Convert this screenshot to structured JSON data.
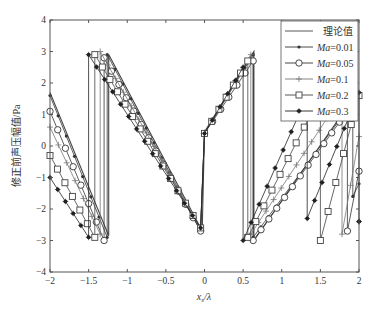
{
  "chart_data": {
    "type": "line",
    "title": "",
    "xlabel": "x_s/λ",
    "xlabel_main": "x",
    "xlabel_sub": "s",
    "xlabel_tail": "/λ",
    "ylabel": "修正前声压幅值/Pa",
    "xlim": [
      -2,
      2
    ],
    "ylim": [
      -4,
      4
    ],
    "xticks": [
      -2,
      -1.5,
      -1,
      -0.5,
      0,
      0.5,
      1,
      1.5,
      2
    ],
    "xtick_labels": [
      "−2",
      "−1.5",
      "−1",
      "−0.5",
      "0",
      "0.5",
      "1",
      "1.5",
      "2"
    ],
    "yticks": [
      -4,
      -3,
      -2,
      -1,
      0,
      1,
      2,
      3,
      4
    ],
    "ytick_labels": [
      "−4",
      "−3",
      "−2",
      "−1",
      "0",
      "1",
      "2",
      "3",
      "4"
    ],
    "grid": false,
    "legend_position": "upper right",
    "series": [
      {
        "name": "理论值",
        "name_prefix": "",
        "name_value": "理论值",
        "marker": "none",
        "color": "#444444",
        "segments": [
          [
            [
              -2,
              1.7
            ],
            [
              -1.24,
              -2.85
            ]
          ],
          [
            [
              -1.24,
              2.9
            ],
            [
              -0.03,
              -2.7
            ]
          ],
          [
            [
              0.0,
              0.45
            ],
            [
              0.64,
              3.0
            ]
          ],
          [
            [
              0.64,
              -3.0
            ],
            [
              1.95,
              1.6
            ]
          ]
        ]
      },
      {
        "name": "Ma=0.01",
        "name_prefix": "Ma",
        "name_value": "=0.01",
        "marker": "dot",
        "color": "#333333",
        "segments": [
          [
            [
              -2,
              1.6
            ],
            [
              -1.26,
              -2.9
            ]
          ],
          [
            [
              -1.26,
              2.9
            ],
            [
              -0.05,
              -2.7
            ]
          ],
          [
            [
              0.0,
              0.4
            ],
            [
              0.63,
              2.9
            ]
          ],
          [
            [
              0.63,
              -2.9
            ],
            [
              1.92,
              1.4
            ]
          ],
          [
            [
              1.92,
              -1.6
            ],
            [
              2.0,
              -1.2
            ]
          ]
        ]
      },
      {
        "name": "Ma=0.05",
        "name_prefix": "Ma",
        "name_value": "=0.05",
        "marker": "circle",
        "color": "#333333",
        "segments": [
          [
            [
              -2,
              1.1
            ],
            [
              -1.3,
              -3.0
            ]
          ],
          [
            [
              -1.3,
              2.8
            ],
            [
              -0.05,
              -2.7
            ]
          ],
          [
            [
              0.0,
              0.4
            ],
            [
              0.63,
              2.7
            ]
          ],
          [
            [
              0.63,
              -3.0
            ],
            [
              1.85,
              1.1
            ]
          ],
          [
            [
              1.85,
              -2.7
            ],
            [
              2.0,
              -0.8
            ]
          ]
        ]
      },
      {
        "name": "Ma=0.1",
        "name_prefix": "Ma",
        "name_value": "=0.1",
        "marker": "plus",
        "color": "#777777",
        "segments": [
          [
            [
              -2,
              0.6
            ],
            [
              -1.35,
              -2.8
            ]
          ],
          [
            [
              -1.35,
              3.0
            ],
            [
              -0.05,
              -2.6
            ]
          ],
          [
            [
              0.0,
              0.4
            ],
            [
              0.6,
              2.9
            ]
          ],
          [
            [
              0.6,
              -2.8
            ],
            [
              1.78,
              1.6
            ]
          ],
          [
            [
              1.78,
              -2.8
            ],
            [
              2.0,
              0.3
            ]
          ]
        ]
      },
      {
        "name": "Ma=0.2",
        "name_prefix": "Ma",
        "name_value": "=0.2",
        "marker": "square",
        "color": "#444444",
        "segments": [
          [
            [
              -2,
              -0.3
            ],
            [
              -1.42,
              -2.9
            ]
          ],
          [
            [
              -1.42,
              2.9
            ],
            [
              -0.05,
              -2.6
            ]
          ],
          [
            [
              0.0,
              0.4
            ],
            [
              0.56,
              2.7
            ]
          ],
          [
            [
              0.56,
              -2.9
            ],
            [
              1.5,
              1.6
            ]
          ],
          [
            [
              1.5,
              -3.0
            ],
            [
              2.0,
              1.6
            ]
          ]
        ]
      },
      {
        "name": "Ma=0.3",
        "name_prefix": "Ma",
        "name_value": "=0.3",
        "marker": "star",
        "color": "#222222",
        "segments": [
          [
            [
              -2,
              -1.0
            ],
            [
              -1.5,
              -2.9
            ]
          ],
          [
            [
              -1.5,
              2.9
            ],
            [
              -0.05,
              -2.6
            ]
          ],
          [
            [
              0.0,
              0.4
            ],
            [
              0.5,
              2.5
            ]
          ],
          [
            [
              0.5,
              -3.0
            ],
            [
              1.33,
              1.6
            ]
          ],
          [
            [
              1.33,
              -2.3
            ],
            [
              2.0,
              1.7
            ]
          ],
          [
            [
              2.0,
              -2.4
            ],
            [
              2.0,
              -2.4
            ]
          ]
        ]
      }
    ]
  }
}
